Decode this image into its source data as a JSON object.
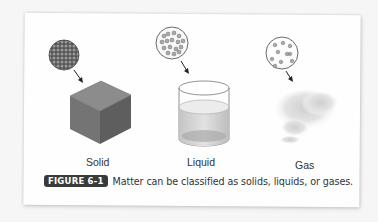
{
  "figure": {
    "states": [
      {
        "label": "Solid",
        "particles": "densely packed",
        "object": "cube"
      },
      {
        "label": "Liquid",
        "particles": "loosely packed, clustered",
        "object": "cylinder container with liquid"
      },
      {
        "label": "Gas",
        "particles": "widely spaced",
        "object": "cloud of gas"
      }
    ],
    "caption": {
      "badge": "FIGURE 6-1",
      "text": "Matter can be classified as solids, liquids, or gases."
    }
  },
  "colors": {
    "badge_bg": "#3a3a3a",
    "cube_top": "#8a8a8a",
    "cube_left": "#707070",
    "cube_right": "#5c5c5c"
  }
}
